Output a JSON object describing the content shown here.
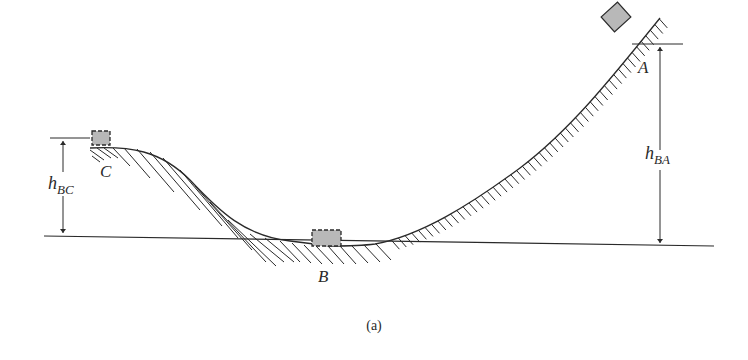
{
  "figure": {
    "caption": "(a)",
    "colors": {
      "line": "#2a2a2a",
      "block_fill": "#b8b8b8",
      "background": "#ffffff"
    },
    "points": {
      "A": {
        "label": "A"
      },
      "B": {
        "label": "B"
      },
      "C": {
        "label": "C"
      }
    },
    "dimensions": {
      "h_BA": {
        "main": "h",
        "sub": "BA"
      },
      "h_BC": {
        "main": "h",
        "sub": "BC"
      }
    },
    "blocks": [
      {
        "position": "A",
        "style": "solid"
      },
      {
        "position": "B",
        "style": "dashed"
      },
      {
        "position": "C",
        "style": "dashed"
      }
    ]
  }
}
